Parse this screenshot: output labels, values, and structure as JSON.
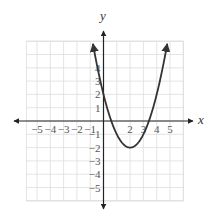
{
  "chart_data": {
    "type": "line",
    "title": "",
    "xlabel": "x",
    "ylabel": "y",
    "function": "y = (x - 2)^2 - 2",
    "vertex": [
      2,
      -2
    ],
    "y_intercept": 2,
    "x_intercepts": [
      0.59,
      3.41
    ],
    "x_tick_labels": [
      "−5",
      "−4",
      "−3",
      "−2",
      "−1",
      "2",
      "3",
      "4",
      "5"
    ],
    "y_tick_labels": [
      "4",
      "3",
      "2",
      "1",
      "−1",
      "−2",
      "−3",
      "−4",
      "−5"
    ],
    "xlim": [
      -5.8,
      6
    ],
    "ylim": [
      -6,
      6
    ],
    "grid": true,
    "curve_color": "#333333",
    "grid_color": "#dddddd",
    "axis_color": "#222222"
  },
  "labels": {
    "x_axis": "x",
    "y_axis": "y"
  }
}
